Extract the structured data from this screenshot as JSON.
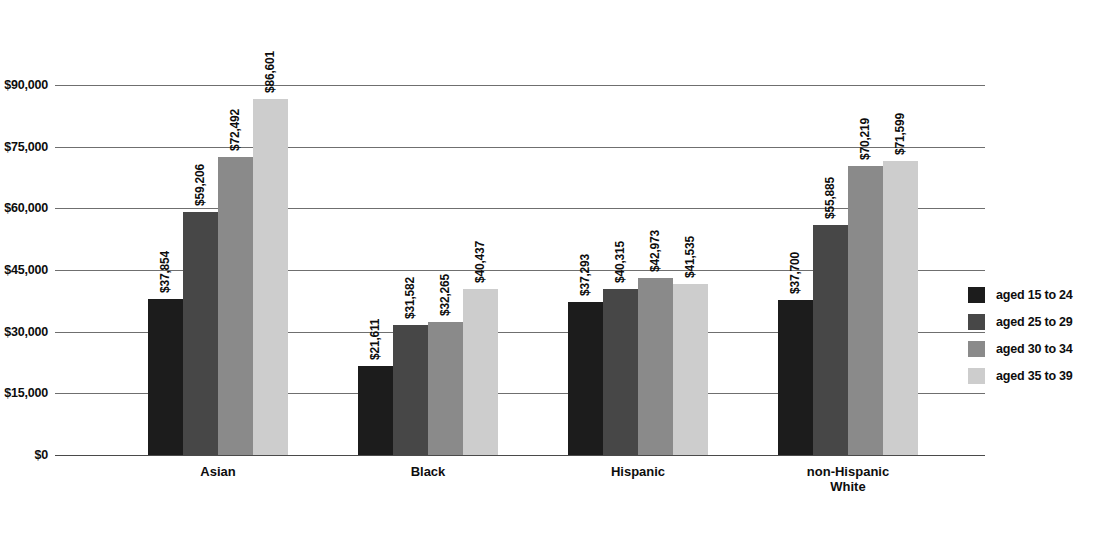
{
  "chart_data": {
    "type": "bar",
    "title": "",
    "subtitle": "",
    "xlabel": "",
    "ylabel": "",
    "grid": true,
    "legend_position": "right",
    "ylim": [
      0,
      90000
    ],
    "yticks": [
      "$0",
      "$15,000",
      "$30,000",
      "$45,000",
      "$60,000",
      "$75,000",
      "$90,000"
    ],
    "ytick_values": [
      0,
      15000,
      30000,
      45000,
      60000,
      75000,
      90000
    ],
    "categories": [
      "Asian",
      "Black",
      "Hispanic",
      "non-Hispanic\nWhite"
    ],
    "series": [
      {
        "name": "aged 15 to 24",
        "color": "#1c1c1c",
        "values": [
          37854,
          21611,
          37293,
          37700
        ],
        "labels": [
          "$37,854",
          "$21,611",
          "$37,293",
          "$37,700"
        ]
      },
      {
        "name": "aged 25 to 29",
        "color": "#474747",
        "values": [
          59206,
          31582,
          40315,
          55885
        ],
        "labels": [
          "$59,206",
          "$31,582",
          "$40,315",
          "$55,885"
        ]
      },
      {
        "name": "aged 30 to 34",
        "color": "#8a8a8a",
        "values": [
          72492,
          32265,
          42973,
          70219
        ],
        "labels": [
          "$72,492",
          "$32,265",
          "$42,973",
          "$70,219"
        ]
      },
      {
        "name": "aged 35 to 39",
        "color": "#cdcdcd",
        "values": [
          86601,
          40437,
          41535,
          71599
        ],
        "labels": [
          "$86,601",
          "$40,437",
          "$41,535",
          "$71,599"
        ]
      }
    ]
  },
  "legend": {
    "items": [
      {
        "label": "aged 15 to 24",
        "color": "#1c1c1c"
      },
      {
        "label": "aged 25 to 29",
        "color": "#474747"
      },
      {
        "label": "aged 30 to 34",
        "color": "#8a8a8a"
      },
      {
        "label": "aged 35 to 39",
        "color": "#cdcdcd"
      }
    ]
  }
}
